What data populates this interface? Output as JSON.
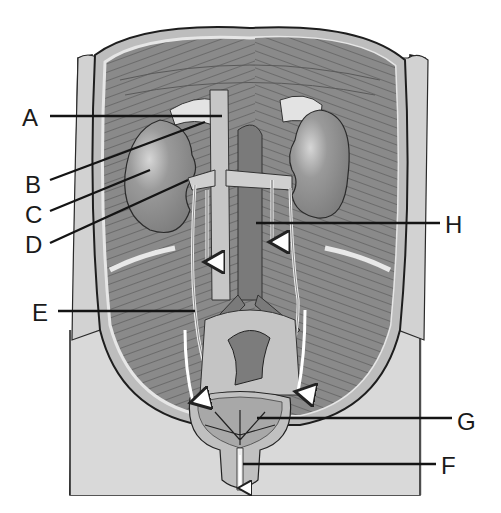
{
  "diagram": {
    "colors": {
      "background": "#ffffff",
      "body_outline": "#1e1e1e",
      "body_fill": "#d9d9d9",
      "muscle_dark": "#7a7a7a",
      "muscle_mid": "#909090",
      "kidney": "#8c8c8c",
      "kidney_highlight": "#cfcfcf",
      "vessel_light": "#c8c8c8",
      "aorta_dark": "#6f6f6f",
      "bladder": "#b0b0b0",
      "leader_line": "#141414"
    },
    "labels": [
      {
        "id": "A",
        "text": "A",
        "x": 22,
        "y": 126,
        "line": [
          50,
          116,
          222,
          116
        ]
      },
      {
        "id": "B",
        "text": "B",
        "x": 25,
        "y": 193,
        "line": [
          50,
          180,
          205,
          122
        ]
      },
      {
        "id": "C",
        "text": "C",
        "x": 25,
        "y": 223,
        "line": [
          50,
          211,
          150,
          170
        ]
      },
      {
        "id": "D",
        "text": "D",
        "x": 25,
        "y": 253,
        "line": [
          50,
          243,
          188,
          180
        ]
      },
      {
        "id": "E",
        "text": "E",
        "x": 32,
        "y": 321,
        "line": [
          58,
          311,
          195,
          311
        ]
      },
      {
        "id": "H",
        "text": "H",
        "x": 445,
        "y": 233,
        "line": [
          256,
          223,
          440,
          223
        ]
      },
      {
        "id": "G",
        "text": "G",
        "x": 457,
        "y": 430,
        "line": [
          257,
          418,
          452,
          418
        ]
      },
      {
        "id": "F",
        "text": "F",
        "x": 441,
        "y": 474,
        "line": [
          243,
          464,
          436,
          464
        ]
      }
    ],
    "arrows": [
      {
        "name": "left-ureter-upper-arrow",
        "x1": 207,
        "y1": 190,
        "x2": 207,
        "y2": 265
      },
      {
        "name": "right-ureter-upper-arrow",
        "x1": 272,
        "y1": 180,
        "x2": 272,
        "y2": 245
      },
      {
        "name": "left-ureter-lower-arrow",
        "x1": 187,
        "y1": 330,
        "x2": 193,
        "y2": 405
      },
      {
        "name": "right-ureter-lower-arrow",
        "x1": 305,
        "y1": 310,
        "x2": 298,
        "y2": 395
      },
      {
        "name": "urethra-outflow-arrow",
        "x1": 240,
        "y1": 440,
        "x2": 240,
        "y2": 490
      }
    ]
  }
}
